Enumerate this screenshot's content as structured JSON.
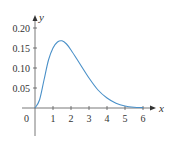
{
  "chart_data": {
    "type": "line",
    "title": "",
    "xlabel": "x",
    "ylabel": "y",
    "xlim": [
      0,
      6.4
    ],
    "ylim": [
      0,
      0.21
    ],
    "grid": false,
    "legend": null,
    "x_ticks": [
      "1",
      "2",
      "3",
      "4",
      "5",
      "6"
    ],
    "y_ticks": [
      "0.05",
      "0.10",
      "0.15",
      "0.20"
    ],
    "origin_label": "0",
    "series": [
      {
        "name": "f(x)",
        "color": "#4a90c8",
        "x": [
          0,
          0.25,
          0.5,
          0.75,
          1.0,
          1.25,
          1.5,
          1.75,
          2.0,
          2.5,
          3.0,
          3.5,
          4.0,
          4.5,
          5.0,
          5.5,
          6.0
        ],
        "y": [
          0,
          0.02,
          0.07,
          0.12,
          0.15,
          0.165,
          0.168,
          0.16,
          0.145,
          0.11,
          0.075,
          0.045,
          0.025,
          0.012,
          0.005,
          0.002,
          0.001
        ]
      }
    ]
  }
}
